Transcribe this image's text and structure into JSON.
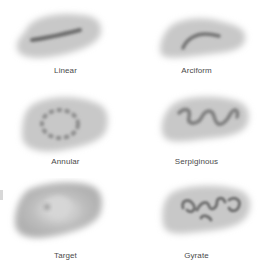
{
  "figure": {
    "panels": [
      {
        "label": "Linear",
        "pattern": "linear"
      },
      {
        "label": "Arciform",
        "pattern": "arciform"
      },
      {
        "label": "Annular",
        "pattern": "annular"
      },
      {
        "label": "Serpiginous",
        "pattern": "serpiginous"
      },
      {
        "label": "Target",
        "pattern": "target"
      },
      {
        "label": "Gyrate",
        "pattern": "gyrate"
      }
    ]
  },
  "colors": {
    "background": "#ffffff",
    "lesion_base": "#c4c4c4",
    "lesion_dark": "#6e6e6e",
    "label": "#4a4a4a"
  }
}
